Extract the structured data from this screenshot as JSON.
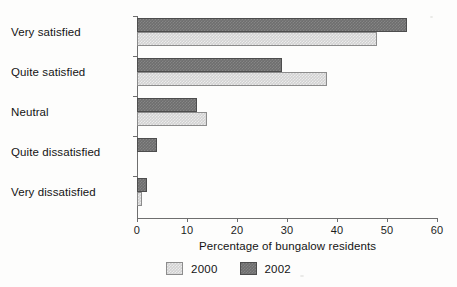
{
  "chart_data": {
    "type": "bar",
    "orientation": "horizontal",
    "title": "",
    "xlabel": "Percentage of bungalow residents",
    "ylabel": "",
    "categories": [
      "Very satisfied",
      "Quite satisfied",
      "Neutral",
      "Quite dissatisfied",
      "Very dissatisfied"
    ],
    "series": [
      {
        "name": "2000",
        "color": "#d2d2d2",
        "values": [
          48,
          38,
          14,
          0,
          1
        ]
      },
      {
        "name": "2002",
        "color": "#6e6e6e",
        "values": [
          54,
          29,
          12,
          4,
          2
        ]
      }
    ],
    "xlim": [
      0,
      60
    ],
    "xticks": [
      0,
      10,
      20,
      30,
      40,
      50,
      60
    ],
    "xtick_labels": [
      "0",
      "10",
      "20",
      "30",
      "40",
      "50",
      "60"
    ],
    "grid": false,
    "legend_position": "bottom-center",
    "legend_entries": [
      "2000",
      "2002"
    ]
  },
  "legend": {
    "items": [
      {
        "label": "2000",
        "swatch": "legend-swatch-2000"
      },
      {
        "label": "2002",
        "swatch": "legend-swatch-2002"
      }
    ]
  },
  "axis": {
    "x_title": "Percentage of bungalow residents"
  }
}
